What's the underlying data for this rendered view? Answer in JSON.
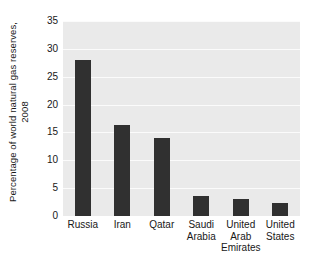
{
  "chart_data": {
    "type": "bar",
    "title": "",
    "subtitle": "",
    "xlabel": "",
    "ylabel": "Percentage of world natural gas reserves, 2008",
    "ylabel_lines": [
      "Percentage of world natural gas reserves,",
      "2008"
    ],
    "categories": [
      "Russia",
      "Iran",
      "Qatar",
      "Saudi Arabia",
      "United Arab Emirates",
      "United States"
    ],
    "category_lines": [
      [
        "Russia"
      ],
      [
        "Iran"
      ],
      [
        "Qatar"
      ],
      [
        "Saudi",
        "Arabia"
      ],
      [
        "United",
        "Arab",
        "Emirates"
      ],
      [
        "United",
        "States"
      ]
    ],
    "values": [
      28.0,
      16.3,
      14.0,
      3.6,
      3.0,
      2.3
    ],
    "ylim": [
      0,
      35
    ],
    "ytick_labels": [
      "0",
      "5",
      "10",
      "15",
      "20",
      "25",
      "30",
      "35"
    ],
    "ytick_values": [
      0,
      5,
      10,
      15,
      20,
      25,
      30,
      35
    ],
    "grid": true,
    "grid_axis": "y",
    "legend": false,
    "legend_position": "none",
    "bar_color": "#303030",
    "plot_background": "#eaeaea",
    "gridline_color": "#fbfbfb",
    "figure_background": "#ffffff"
  }
}
